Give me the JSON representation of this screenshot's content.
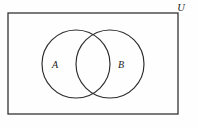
{
  "figure": {
    "type": "venn-diagram",
    "background_color": "#fefefe",
    "stroke_color": "#2b2b2b",
    "canvas": {
      "width": 198,
      "height": 128
    }
  },
  "universe": {
    "label": "U",
    "label_position": {
      "x": 181,
      "y": 11
    },
    "rect": {
      "x": 8,
      "y": 13,
      "width": 170,
      "height": 101
    }
  },
  "sets": [
    {
      "label": "A",
      "label_position": {
        "x": 55,
        "y": 68
      },
      "circle": {
        "cx": 76,
        "cy": 64,
        "r": 34
      }
    },
    {
      "label": "B",
      "label_position": {
        "x": 121,
        "y": 68
      },
      "circle": {
        "cx": 110,
        "cy": 64,
        "r": 34
      }
    }
  ]
}
